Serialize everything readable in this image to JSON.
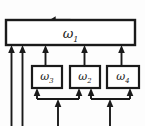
{
  "diagram": {
    "type": "block-diagram",
    "background_color": "#fdfdfd",
    "stroke_color": "#1a1a1a",
    "boxes": [
      {
        "id": "top",
        "symbol": "ω",
        "subscript": "1",
        "x": 6,
        "y": 20,
        "width": 129,
        "height": 25
      },
      {
        "id": "left",
        "symbol": "ω",
        "subscript": "3",
        "x": 32,
        "y": 66,
        "width": 30,
        "height": 22
      },
      {
        "id": "middle",
        "symbol": "ω",
        "subscript": "2",
        "x": 70,
        "y": 66,
        "width": 30,
        "height": 22
      },
      {
        "id": "right",
        "symbol": "ω",
        "subscript": "4",
        "x": 107,
        "y": 66,
        "width": 32,
        "height": 22
      }
    ],
    "arrows": {
      "output_top": "up-arrow-from-top-box",
      "into_top_box": 5,
      "into_lower_boxes": 4,
      "external_inputs": 4
    }
  }
}
